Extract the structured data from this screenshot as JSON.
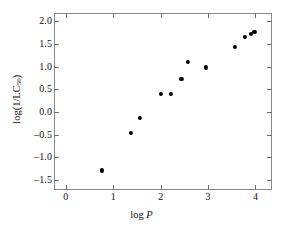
{
  "chart_data": {
    "type": "scatter",
    "title": "",
    "xlabel": "log P",
    "ylabel": "log(1/LC50)",
    "ylabel_parts": {
      "prefix": "log(1/LC",
      "subscript": "50",
      "suffix": ")"
    },
    "xlabel_parts": {
      "prefix": "log ",
      "italic": "P"
    },
    "xlim": [
      -0.25,
      4.35
    ],
    "ylim": [
      -1.72,
      2.18
    ],
    "xticks": [
      0,
      1,
      2,
      3,
      4
    ],
    "xtick_labels": [
      "0",
      "1",
      "2",
      "3",
      "4"
    ],
    "yticks": [
      -1.5,
      -1.0,
      -0.5,
      0.0,
      0.5,
      1.0,
      1.5,
      2.0
    ],
    "ytick_labels": [
      "–1.5",
      "–1.0",
      "–0.5",
      "0.0",
      "0.5",
      "1.0",
      "1.5",
      "2.0"
    ],
    "grid": false,
    "legend": false,
    "marker": "filled-circle",
    "marker_color": "#000000",
    "frame_color": "#8a8a8a",
    "background": "#ffffff",
    "x": [
      0.76,
      1.37,
      1.57,
      2.0,
      2.22,
      2.44,
      2.58,
      2.96,
      3.57,
      3.78,
      3.9,
      3.98
    ],
    "y": [
      -1.29,
      -0.46,
      -0.14,
      0.39,
      0.39,
      0.72,
      1.11,
      0.98,
      1.43,
      1.65,
      1.72,
      1.77
    ],
    "points": [
      {
        "x": 0.76,
        "y": -1.29
      },
      {
        "x": 1.37,
        "y": -0.46
      },
      {
        "x": 1.57,
        "y": -0.14
      },
      {
        "x": 2.0,
        "y": 0.39
      },
      {
        "x": 2.22,
        "y": 0.39
      },
      {
        "x": 2.44,
        "y": 0.72
      },
      {
        "x": 2.58,
        "y": 1.11
      },
      {
        "x": 2.96,
        "y": 0.98
      },
      {
        "x": 3.57,
        "y": 1.43
      },
      {
        "x": 3.78,
        "y": 1.65
      },
      {
        "x": 3.9,
        "y": 1.72
      },
      {
        "x": 3.98,
        "y": 1.77
      }
    ]
  }
}
